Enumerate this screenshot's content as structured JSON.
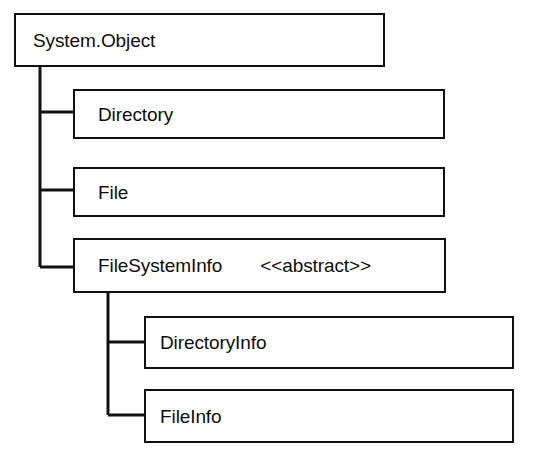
{
  "diagram": {
    "type": "class-hierarchy-tree",
    "line_color": "#111111",
    "box_fill": "#ffffff",
    "text_color": "#0d0d0d",
    "background": "#fefefe",
    "nodes": {
      "root": {
        "label": "System.Object",
        "stereotype": ""
      },
      "directory": {
        "label": "Directory",
        "stereotype": ""
      },
      "file": {
        "label": "File",
        "stereotype": ""
      },
      "filesysteminfo": {
        "label": "FileSystemInfo",
        "stereotype": "<<abstract>>"
      },
      "directoryinfo": {
        "label": "DirectoryInfo",
        "stereotype": ""
      },
      "fileinfo": {
        "label": "FileInfo",
        "stereotype": ""
      }
    },
    "edges": [
      {
        "from": "root",
        "to": "directory"
      },
      {
        "from": "root",
        "to": "file"
      },
      {
        "from": "root",
        "to": "filesysteminfo"
      },
      {
        "from": "filesysteminfo",
        "to": "directoryinfo"
      },
      {
        "from": "filesysteminfo",
        "to": "fileinfo"
      }
    ]
  }
}
